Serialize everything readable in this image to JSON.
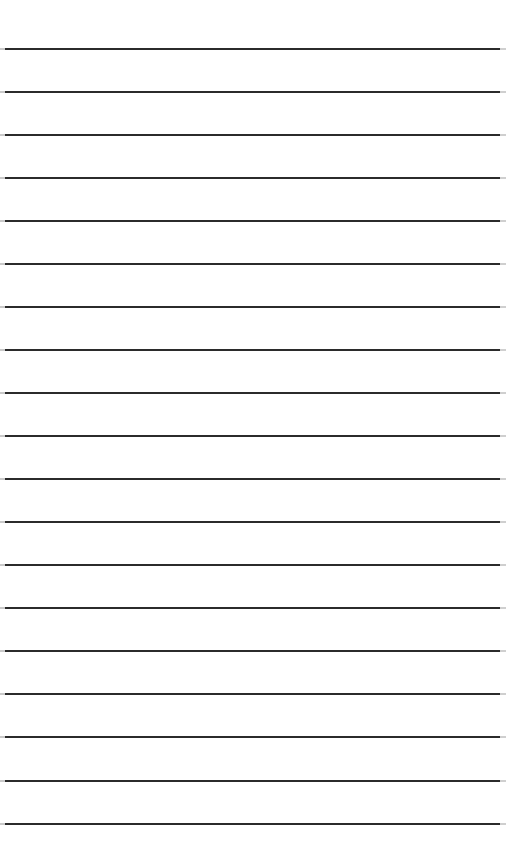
{
  "page": {
    "kind": "ruled-paper-sheet",
    "width": 506,
    "height": 867,
    "background_color": "#ffffff",
    "content_text": ""
  },
  "ruling": {
    "line_count": 19,
    "first_line_y": 49,
    "line_spacing": 43.1,
    "last_line_y": 824,
    "stroke_thickness": 2.5,
    "stroke_color": "#2b2b2b",
    "cap_color_left": "#c9c9c9",
    "cap_color_right": "#cfcfcf",
    "cap_width_left": 5,
    "cap_width_right": 6,
    "line_inset_left": 0,
    "line_inset_right": 0
  },
  "margins": {
    "top_height": 49,
    "bottom_height": 43,
    "left_width": 0,
    "right_width": 0
  },
  "lines": [
    {
      "index": 1,
      "y": 49,
      "text": ""
    },
    {
      "index": 2,
      "y": 92,
      "text": ""
    },
    {
      "index": 3,
      "y": 135,
      "text": ""
    },
    {
      "index": 4,
      "y": 178,
      "text": ""
    },
    {
      "index": 5,
      "y": 221,
      "text": ""
    },
    {
      "index": 6,
      "y": 264,
      "text": ""
    },
    {
      "index": 7,
      "y": 307,
      "text": ""
    },
    {
      "index": 8,
      "y": 350,
      "text": ""
    },
    {
      "index": 9,
      "y": 393,
      "text": ""
    },
    {
      "index": 10,
      "y": 436,
      "text": ""
    },
    {
      "index": 11,
      "y": 479,
      "text": ""
    },
    {
      "index": 12,
      "y": 522,
      "text": ""
    },
    {
      "index": 13,
      "y": 565,
      "text": ""
    },
    {
      "index": 14,
      "y": 608,
      "text": ""
    },
    {
      "index": 15,
      "y": 651,
      "text": ""
    },
    {
      "index": 16,
      "y": 694,
      "text": ""
    },
    {
      "index": 17,
      "y": 737,
      "text": ""
    },
    {
      "index": 18,
      "y": 781,
      "text": ""
    },
    {
      "index": 19,
      "y": 824,
      "text": ""
    }
  ]
}
